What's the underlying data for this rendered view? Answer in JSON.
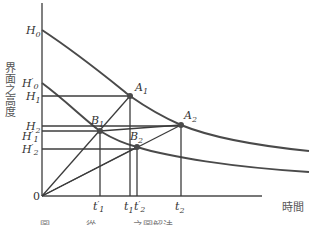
{
  "diagram": {
    "y_axis_label": "界面之高度",
    "x_axis_label": "時間",
    "origin_label": "0",
    "y_labels": [
      {
        "id": "H0",
        "main": "H",
        "prime": "",
        "sub": "0",
        "y": 30
      },
      {
        "id": "H'0",
        "main": "H",
        "prime": "′",
        "sub": "0",
        "y": 83
      },
      {
        "id": "H1",
        "main": "H",
        "prime": "",
        "sub": "1",
        "y": 96
      },
      {
        "id": "H2",
        "main": "H",
        "prime": "",
        "sub": "2",
        "y": 126
      },
      {
        "id": "H'1",
        "main": "H",
        "prime": "′",
        "sub": "1",
        "y": 132
      },
      {
        "id": "H'2",
        "main": "H",
        "prime": "′",
        "sub": "2",
        "y": 149
      }
    ],
    "x_labels": [
      {
        "id": "t'1",
        "main": "t",
        "prime": "′",
        "sub": "1",
        "x": 100
      },
      {
        "id": "t1",
        "main": "t",
        "prime": "",
        "sub": "1",
        "x": 130
      },
      {
        "id": "t'2",
        "main": "t",
        "prime": "′",
        "sub": "2",
        "x": 137
      },
      {
        "id": "t2",
        "main": "t",
        "prime": "",
        "sub": "2",
        "x": 181
      }
    ],
    "points": [
      {
        "id": "A1",
        "main": "A",
        "sub": "1",
        "x": 130,
        "y": 96
      },
      {
        "id": "A2",
        "main": "A",
        "sub": "2",
        "x": 181,
        "y": 125
      },
      {
        "id": "B1",
        "main": "B",
        "sub": "1",
        "x": 100,
        "y": 131
      },
      {
        "id": "B2",
        "main": "B",
        "sub": "2",
        "x": 137,
        "y": 147
      }
    ],
    "curves": [
      {
        "id": "upper-settling-curve",
        "from": "H0"
      },
      {
        "id": "lower-settling-curve",
        "from": "H'0"
      }
    ],
    "caption_partial": "圖 ……… 從 ……… 之圖解法"
  }
}
